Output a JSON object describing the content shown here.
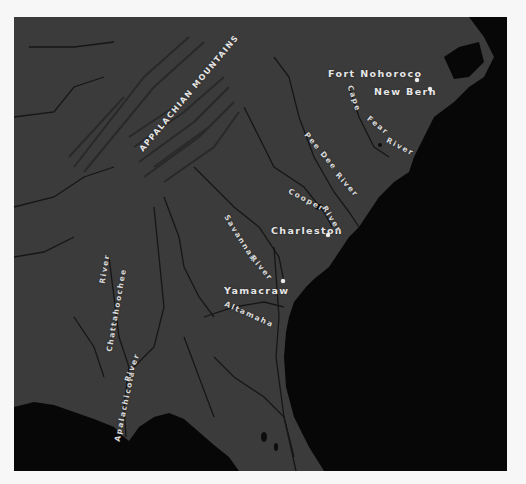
{
  "colors": {
    "background": "#f7f7f7",
    "land": "#3b3b3b",
    "ocean": "#070707",
    "rivers": "#151515",
    "label": "#e6e6e6"
  },
  "map": {
    "region_label": "APPALACHIAN MOUNTAINS",
    "cities": [
      {
        "name": "Fort Nohoroco"
      },
      {
        "name": "New Bern"
      },
      {
        "name": "Charleston"
      },
      {
        "name": "Yamacraw"
      }
    ],
    "rivers": [
      {
        "name": "Cape Fear River"
      },
      {
        "name": "Pee Dee River"
      },
      {
        "name": "Cooper River"
      },
      {
        "name": "Savannah River"
      },
      {
        "name": "Altamaha"
      },
      {
        "name": "Chattahoochee River"
      },
      {
        "name": "Apalachicola River"
      }
    ],
    "river_parts": {
      "cape": "Cape",
      "fear": "Fear",
      "river": "River",
      "pee_dee": "Pee Dee",
      "cooper": "Cooper",
      "savannah": "Savannah",
      "chattahoochee": "Chattahoochee",
      "apalachicola": "Apalachicola"
    }
  }
}
